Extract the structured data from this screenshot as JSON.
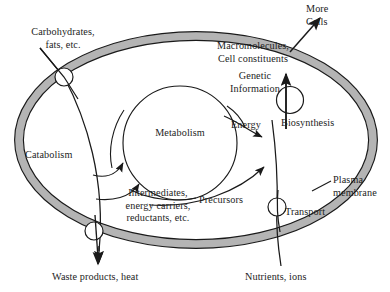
{
  "figure": {
    "type": "biology-concept-diagram",
    "background_color": "#ffffff",
    "membrane_fill_color": "#b4b4b4",
    "stroke_color": "#1a1a1a"
  },
  "labels": {
    "carbohydrates_line1": "Carbohydrates,",
    "carbohydrates_line2": "fats, etc.",
    "more_cells_line1": "More",
    "more_cells_line2": "Cells",
    "macromolecules_line1": "Macromolecules,",
    "macromolecules_line2": "Cell constituents",
    "genetic_line1": "Genetic",
    "genetic_line2": "Information",
    "energy": "Energy",
    "biosynthesis": "Biosynthesis",
    "metabolism": "Metabolism",
    "catabolism": "Catabolism",
    "intermediates_line1": "Intermediates,",
    "intermediates_line2": "energy carriers,",
    "intermediates_line3": "reductants, etc.",
    "precursors": "Precursors",
    "plasma_line1": "Plasma",
    "plasma_line2": "membrane",
    "transport": "Transport",
    "waste": "Waste products, heat",
    "nutrients": "Nutrients, ions"
  },
  "elements": {
    "membrane_label_leader": "leader-line",
    "pores": [
      {
        "name": "pore-carbohydrate-entry",
        "cx": 64,
        "cy": 77,
        "r": 9
      },
      {
        "name": "pore-waste-exit",
        "cx": 94,
        "cy": 231,
        "r": 9
      },
      {
        "name": "pore-transport-entry",
        "cx": 277,
        "cy": 207,
        "r": 9
      },
      {
        "name": "pore-biosynthesis-export",
        "cx": 290,
        "cy": 100,
        "r": 13.5
      }
    ],
    "arrows": [
      {
        "name": "arrow-carbohydrates-in",
        "direction": "down-right",
        "from": "outside-top-left",
        "to": "catabolism"
      },
      {
        "name": "arrow-catabolism-to-metabolism-upper",
        "direction": "up",
        "to": "metabolism"
      },
      {
        "name": "arrow-catabolism-to-metabolism-lower",
        "direction": "up",
        "to": "metabolism"
      },
      {
        "name": "arrow-waste-out",
        "direction": "down",
        "to": "waste-products"
      },
      {
        "name": "arrow-energy-to-biosynthesis",
        "direction": "right-down",
        "to": "biosynthesis"
      },
      {
        "name": "arrow-precursors-to-biosynthesis",
        "direction": "up-right",
        "to": "biosynthesis"
      },
      {
        "name": "arrow-biosynthesis-to-macromolecules",
        "direction": "up",
        "to": "macromolecules"
      },
      {
        "name": "arrow-macromolecules-to-more-cells",
        "direction": "up-right",
        "to": "more-cells"
      },
      {
        "name": "arrow-nutrients-in",
        "direction": "up-left",
        "to": "precursors"
      }
    ]
  }
}
